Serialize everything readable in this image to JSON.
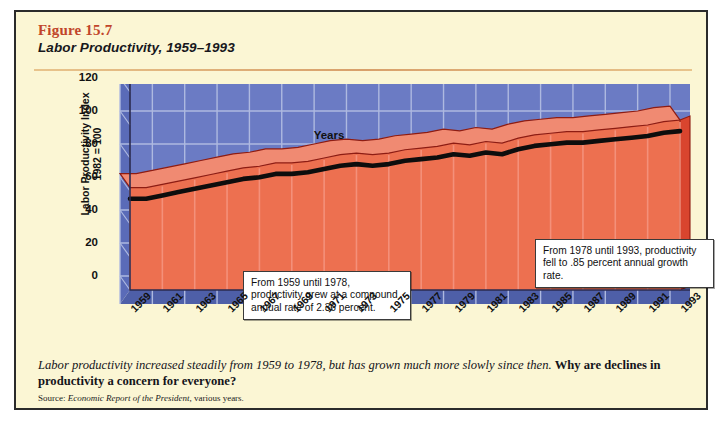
{
  "figure": {
    "number": "Figure 15.7",
    "title": "Labor Productivity, 1959–1993"
  },
  "caption": {
    "lead": "Labor productivity increased steadily from 1959 to 1978, but has grown much more slowly since then. ",
    "question": "Why are declines in productivity a concern for everyone?",
    "source_prefix": "Source: ",
    "source_italic": "Economic Report of the President",
    "source_rest": ", various years."
  },
  "annotations": [
    {
      "id": "left",
      "text": "From 1959 until 1978, productivity grew at a compound annual rate of 2.36 percent."
    },
    {
      "id": "right",
      "text": "From 1978 until 1993, productivity fell to .85 percent annual growth rate."
    }
  ],
  "colors": {
    "page_background": "#FBF6D4",
    "border": "#2b2b2b",
    "figure_number": "#C1452B",
    "rule": "#D8A06A",
    "plot_background": "#6B7BC4",
    "plot_gridline": "#AEB9E0",
    "area_front": "#ED7050",
    "area_stripe": "#F4907A",
    "area_top": "#F08A72",
    "area_side": "#D9452E",
    "area_outline": "#8E1C12",
    "front_line": "#0d0d0d",
    "floor": "#4E5FA8"
  },
  "chart_data": {
    "type": "area",
    "title": "Labor Productivity, 1959–1993",
    "xlabel": "Years",
    "ylabel": "Labor Productivity Index\n1982 = 100",
    "ylim": [
      0,
      120
    ],
    "yticks": [
      0,
      20,
      40,
      60,
      80,
      100,
      120
    ],
    "grid": true,
    "legend": "none",
    "xticks": [
      1959,
      1961,
      1963,
      1965,
      1967,
      1969,
      1971,
      1973,
      1975,
      1977,
      1979,
      1981,
      1983,
      1985,
      1987,
      1989,
      1991,
      1993
    ],
    "x": [
      1959,
      1960,
      1961,
      1962,
      1963,
      1964,
      1965,
      1966,
      1967,
      1968,
      1969,
      1970,
      1971,
      1972,
      1973,
      1974,
      1975,
      1976,
      1977,
      1978,
      1979,
      1980,
      1981,
      1982,
      1983,
      1984,
      1985,
      1986,
      1987,
      1988,
      1989,
      1990,
      1991,
      1992,
      1993
    ],
    "series": [
      {
        "name": "Labor Productivity Index (1982 = 100)",
        "values": [
          62,
          62,
          64,
          66,
          68,
          70,
          72,
          74,
          75,
          77,
          77,
          78,
          80,
          82,
          83,
          82,
          83,
          85,
          86,
          87,
          89,
          88,
          90,
          89,
          92,
          94,
          95,
          96,
          96,
          97,
          98,
          99,
          100,
          102,
          103
        ]
      }
    ],
    "annotation_periods": [
      {
        "from": 1959,
        "to": 1978,
        "growth_rate_percent": 2.36
      },
      {
        "from": 1978,
        "to": 1993,
        "growth_rate_percent": 0.85
      }
    ]
  }
}
